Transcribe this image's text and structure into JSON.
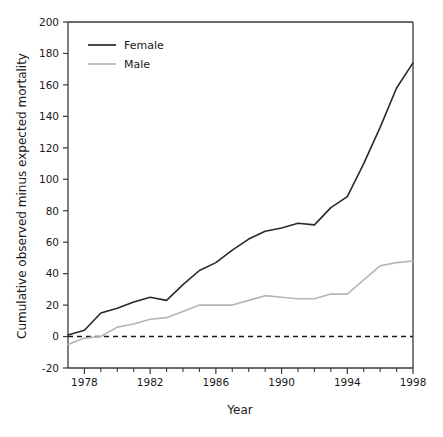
{
  "chart_data": {
    "type": "line",
    "title": "",
    "xlabel": "Year",
    "ylabel": "Cumulative observed minus expected mortality",
    "xlim": [
      1977,
      1998
    ],
    "ylim": [
      -20,
      200
    ],
    "xticks": [
      1978,
      1982,
      1986,
      1990,
      1994,
      1998
    ],
    "xtick_labels": [
      "1978",
      "1982",
      "1986",
      "1990",
      "1994",
      "1998"
    ],
    "minor_xticks": [
      1978,
      1979,
      1980,
      1981,
      1982,
      1983,
      1984,
      1985,
      1986,
      1987,
      1988,
      1989,
      1990,
      1991,
      1992,
      1993,
      1994,
      1995,
      1996,
      1997,
      1998
    ],
    "yticks": [
      -20,
      0,
      20,
      40,
      60,
      80,
      100,
      120,
      140,
      160,
      180,
      200
    ],
    "ytick_labels": [
      "-20",
      "0",
      "20",
      "40",
      "60",
      "80",
      "100",
      "120",
      "140",
      "160",
      "180",
      "200"
    ],
    "grid": false,
    "legend_position": "upper left",
    "reference_line": {
      "value": 0,
      "style": "dashed",
      "color": "#1a1a1a",
      "label": "zero-reference-line"
    },
    "x": [
      1977,
      1978,
      1979,
      1980,
      1981,
      1982,
      1983,
      1984,
      1985,
      1986,
      1987,
      1988,
      1989,
      1990,
      1991,
      1992,
      1993,
      1994,
      1995,
      1996,
      1997,
      1998
    ],
    "series": [
      {
        "name": "Female",
        "color": "#2a2a2a",
        "linewidth": 1.6,
        "values": [
          1,
          4,
          15,
          18,
          22,
          25,
          23,
          33,
          42,
          47,
          55,
          62,
          67,
          69,
          72,
          71,
          82,
          89,
          110,
          133,
          158,
          174
        ]
      },
      {
        "name": "Male",
        "color": "#b5b5b5",
        "linewidth": 1.6,
        "values": [
          -5,
          -1,
          0,
          6,
          8,
          11,
          12,
          16,
          20,
          20,
          20,
          23,
          26,
          25,
          24,
          24,
          27,
          27,
          36,
          45,
          47,
          48
        ]
      }
    ]
  },
  "legend": {
    "entries": [
      {
        "label": "Female",
        "color": "#2a2a2a"
      },
      {
        "label": "Male",
        "color": "#b5b5b5"
      }
    ]
  },
  "axes": {
    "x_title": "Year",
    "y_title": "Cumulative observed minus expected mortality"
  }
}
